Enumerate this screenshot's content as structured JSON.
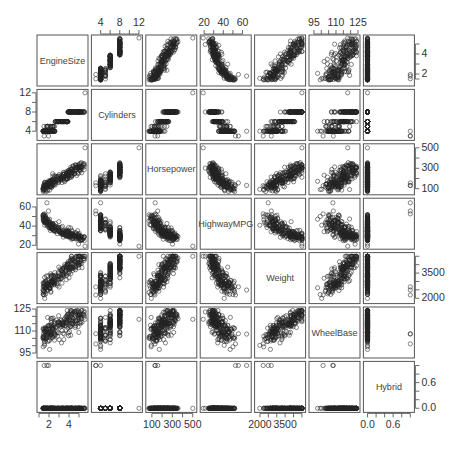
{
  "chart_data": {
    "type": "scatter-matrix",
    "title": "",
    "variables": [
      "EngineSize",
      "Cylinders",
      "Horsepower",
      "HighwayMPG",
      "Weight",
      "WheelBase",
      "Hybrid"
    ],
    "ranges": {
      "EngineSize": [
        1.0,
        5.7
      ],
      "Cylinders": [
        2.5,
        12.3
      ],
      "Horsepower": [
        60,
        520
      ],
      "HighwayMPG": [
        18,
        67
      ],
      "Weight": [
        1800,
        4600
      ],
      "WheelBase": [
        93,
        125
      ],
      "Hybrid": [
        -0.05,
        1.05
      ]
    },
    "axes": {
      "top": [
        {
          "var": "Cylinders",
          "ticks": [
            4,
            6,
            8,
            10,
            12
          ],
          "labels": [
            "4",
            "8",
            "12"
          ]
        },
        {
          "var": "HighwayMPG",
          "ticks": [
            20,
            30,
            40,
            50,
            60
          ],
          "labels": [
            "20",
            "40",
            "60"
          ]
        },
        {
          "var": "WheelBase",
          "ticks": [
            95,
            100,
            105,
            110,
            115,
            120,
            125
          ],
          "labels": [
            "95",
            "110",
            "125"
          ]
        }
      ],
      "bottom": [
        {
          "var": "EngineSize",
          "ticks": [
            1,
            2,
            3,
            4,
            5
          ],
          "labels": [
            "2",
            "4"
          ]
        },
        {
          "var": "Horsepower",
          "ticks": [
            100,
            200,
            300,
            400,
            500
          ],
          "labels": [
            "100",
            "300",
            "500"
          ]
        },
        {
          "var": "Weight",
          "ticks": [
            2000,
            2500,
            3000,
            3500,
            4000,
            4500
          ],
          "labels": [
            "2000",
            "3500"
          ]
        },
        {
          "var": "Hybrid",
          "ticks": [
            0,
            0.2,
            0.4,
            0.6,
            0.8,
            1.0
          ],
          "labels": [
            "0.0",
            "0.6"
          ]
        }
      ],
      "left": [
        {
          "var": "Cylinders",
          "ticks": [
            4,
            6,
            8,
            10,
            12
          ],
          "labels": [
            "4",
            "8",
            "12"
          ]
        },
        {
          "var": "HighwayMPG",
          "ticks": [
            20,
            30,
            40,
            50,
            60
          ],
          "labels": [
            "20",
            "40",
            "60"
          ]
        },
        {
          "var": "WheelBase",
          "ticks": [
            95,
            100,
            105,
            110,
            115,
            120,
            125
          ],
          "labels": [
            "95",
            "110",
            "125"
          ]
        }
      ],
      "right": [
        {
          "var": "EngineSize",
          "ticks": [
            1.5,
            2,
            3,
            4,
            5
          ],
          "labels": [
            "2",
            "4"
          ]
        },
        {
          "var": "Horsepower",
          "ticks": [
            100,
            200,
            300,
            400,
            500
          ],
          "labels": [
            "100",
            "300",
            "500"
          ]
        },
        {
          "var": "Weight",
          "ticks": [
            2000,
            2500,
            3000,
            3500,
            4000,
            4500
          ],
          "labels": [
            "2000",
            "3500"
          ]
        },
        {
          "var": "Hybrid",
          "ticks": [
            0,
            0.2,
            0.4,
            0.6,
            0.8,
            1.0
          ],
          "labels": [
            "0.0",
            "0.6"
          ]
        }
      ]
    },
    "relationships": {
      "EngineSize~Cylinders": "strong positive, cylinders in discrete levels 4,5,6,8 (one outlier at 12)",
      "EngineSize~Horsepower": "strong positive",
      "EngineSize~HighwayMPG": "negative, curved",
      "EngineSize~Weight": "strong positive",
      "EngineSize~WheelBase": "positive",
      "Horsepower~HighwayMPG": "negative, curved",
      "Horsepower~Weight": "positive",
      "HighwayMPG~Weight": "negative",
      "Weight~WheelBase": "strong positive, near linear",
      "Hybrid": "binary 0/1; hybrids have small engines, high MPG, low weight"
    },
    "n_points_approx": 230,
    "marker": "open circle",
    "grid": false,
    "legend": null
  }
}
